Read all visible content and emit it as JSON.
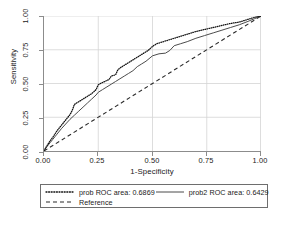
{
  "chart_data": {
    "type": "line",
    "title": "",
    "xlabel": "1-Specificity",
    "ylabel": "Sensitivity",
    "xlim": [
      0,
      1
    ],
    "ylim": [
      0,
      1
    ],
    "grid": true,
    "legend_position": "below-plot",
    "xticks": [
      "0.00",
      "0.25",
      "0.50",
      "0.75",
      "1.00"
    ],
    "yticks": [
      "0.00",
      "0.25",
      "0.50",
      "0.75",
      "1.00"
    ],
    "xtick_values": [
      0,
      0.25,
      0.5,
      0.75,
      1
    ],
    "ytick_values": [
      0,
      0.25,
      0.5,
      0.75,
      1
    ],
    "series": [
      {
        "name": "prob ROC area: 0.6869",
        "short_name": "prob",
        "auc": 0.6869,
        "style": "dotted",
        "color": "#111111",
        "x": [
          0.0,
          0.01,
          0.02,
          0.03,
          0.04,
          0.05,
          0.06,
          0.07,
          0.08,
          0.09,
          0.1,
          0.11,
          0.12,
          0.13,
          0.14,
          0.15,
          0.16,
          0.17,
          0.18,
          0.19,
          0.2,
          0.22,
          0.24,
          0.25,
          0.26,
          0.28,
          0.3,
          0.31,
          0.32,
          0.33,
          0.34,
          0.35,
          0.36,
          0.38,
          0.4,
          0.42,
          0.44,
          0.46,
          0.48,
          0.5,
          0.52,
          0.54,
          0.56,
          0.58,
          0.6,
          0.63,
          0.66,
          0.7,
          0.74,
          0.78,
          0.82,
          0.86,
          0.9,
          0.94,
          0.97,
          1.0
        ],
        "y": [
          0.0,
          0.03,
          0.055,
          0.08,
          0.1,
          0.125,
          0.15,
          0.17,
          0.19,
          0.21,
          0.23,
          0.25,
          0.27,
          0.3,
          0.345,
          0.355,
          0.365,
          0.375,
          0.385,
          0.395,
          0.405,
          0.425,
          0.455,
          0.49,
          0.5,
          0.515,
          0.53,
          0.555,
          0.56,
          0.565,
          0.6,
          0.615,
          0.625,
          0.645,
          0.665,
          0.685,
          0.705,
          0.725,
          0.745,
          0.775,
          0.795,
          0.805,
          0.815,
          0.825,
          0.835,
          0.85,
          0.865,
          0.885,
          0.9,
          0.915,
          0.93,
          0.945,
          0.955,
          0.975,
          0.99,
          1.0
        ]
      },
      {
        "name": "prob2 ROC area: 0.6429",
        "short_name": "prob2",
        "auc": 0.6429,
        "style": "solid",
        "color": "#4a4a4a",
        "x": [
          0.0,
          0.01,
          0.02,
          0.03,
          0.04,
          0.05,
          0.06,
          0.08,
          0.1,
          0.12,
          0.14,
          0.16,
          0.18,
          0.2,
          0.22,
          0.24,
          0.25,
          0.27,
          0.29,
          0.31,
          0.33,
          0.35,
          0.37,
          0.39,
          0.41,
          0.43,
          0.45,
          0.47,
          0.5,
          0.53,
          0.56,
          0.58,
          0.6,
          0.63,
          0.66,
          0.7,
          0.74,
          0.78,
          0.82,
          0.86,
          0.9,
          0.94,
          0.97,
          1.0
        ],
        "y": [
          0.0,
          0.025,
          0.045,
          0.065,
          0.085,
          0.105,
          0.125,
          0.165,
          0.2,
          0.235,
          0.265,
          0.295,
          0.325,
          0.355,
          0.385,
          0.415,
          0.435,
          0.455,
          0.475,
          0.495,
          0.515,
          0.535,
          0.555,
          0.575,
          0.595,
          0.625,
          0.645,
          0.665,
          0.705,
          0.72,
          0.725,
          0.745,
          0.78,
          0.795,
          0.81,
          0.835,
          0.855,
          0.875,
          0.895,
          0.915,
          0.935,
          0.96,
          0.98,
          1.0
        ]
      },
      {
        "name": "Reference",
        "short_name": "Reference",
        "style": "dashed",
        "color": "#2b2b2b",
        "x": [
          0,
          1
        ],
        "y": [
          0,
          1
        ]
      }
    ]
  },
  "legend": {
    "rows": [
      [
        {
          "label": "prob ROC area: 0.6869",
          "sample": "dotted-line-sample"
        },
        {
          "label": "prob2 ROC area: 0.6429",
          "sample": "solid-line-sample"
        }
      ],
      [
        {
          "label": "Reference",
          "sample": "dashed-line-sample"
        }
      ]
    ]
  },
  "caption": {
    "text": ""
  }
}
